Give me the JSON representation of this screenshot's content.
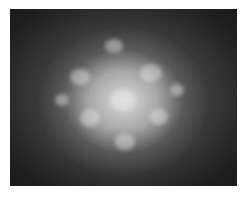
{
  "image": {
    "description": "Grayscale photograph of a bright diffuse star-shaped glow on a dark background",
    "colors": {
      "background": "#2a2a2a",
      "glow": "#e1e1e1",
      "border": "#ffffff"
    }
  }
}
